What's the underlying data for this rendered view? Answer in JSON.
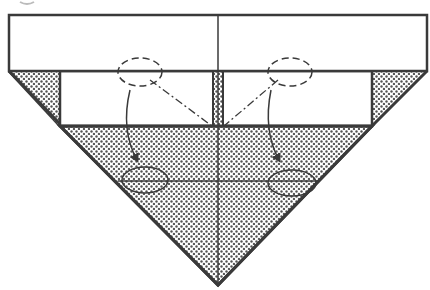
{
  "diagram": {
    "type": "origami-folding-step",
    "step_marker": "partial circle (cropped) at top-left",
    "colors": {
      "line": "#3a3a3a",
      "paper": "#ffffff",
      "shade_dot": "#555555",
      "background": "#ffffff"
    },
    "regions": [
      {
        "name": "top-band",
        "fill": "white",
        "points": [
          [
            9,
            15
          ],
          [
            427,
            15
          ],
          [
            427,
            71
          ],
          [
            9,
            71
          ]
        ]
      },
      {
        "name": "inner-band",
        "fill": "white",
        "points": [
          [
            60,
            71
          ],
          [
            372,
            71
          ],
          [
            372,
            126
          ],
          [
            60,
            126
          ]
        ]
      },
      {
        "name": "left-shaded-flap",
        "fill": "dotted",
        "points": [
          [
            9,
            71
          ],
          [
            60,
            71
          ],
          [
            60,
            126
          ]
        ]
      },
      {
        "name": "right-shaded-flap",
        "fill": "dotted",
        "points": [
          [
            372,
            71
          ],
          [
            427,
            71
          ],
          [
            372,
            126
          ]
        ]
      },
      {
        "name": "center-shaded-strip",
        "fill": "dotted",
        "points": [
          [
            213,
            71
          ],
          [
            223,
            71
          ],
          [
            223,
            126
          ],
          [
            213,
            126
          ]
        ]
      },
      {
        "name": "bottom-shaded-triangle",
        "fill": "dotted",
        "points": [
          [
            60,
            126
          ],
          [
            372,
            126
          ],
          [
            218,
            285
          ]
        ]
      }
    ],
    "annotations": {
      "source_ellipses": [
        {
          "cx": 140,
          "cy": 72,
          "rx": 22,
          "ry": 14
        },
        {
          "cx": 290,
          "cy": 72,
          "rx": 22,
          "ry": 14
        }
      ],
      "target_ellipses": [
        {
          "cx": 145,
          "cy": 180,
          "rx": 23,
          "ry": 13
        },
        {
          "cx": 292,
          "cy": 183,
          "rx": 24,
          "ry": 13
        }
      ],
      "fold_lines": "dash-dot from each source ellipse to center bottom (218,126)",
      "arrows": "curved arrows from source ellipses down to target ellipses"
    }
  }
}
